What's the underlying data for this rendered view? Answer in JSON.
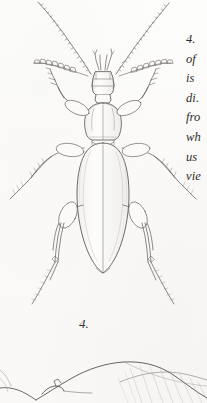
{
  "plate": {
    "background_color": "#fbfaf8",
    "ink_color": "#4a4743",
    "ink_light_color": "#8f8b86",
    "figure_number_label": "4.",
    "caption": {
      "note": "Italic caption text clipped by the right page margin",
      "lines": [
        "4.",
        "of",
        "is",
        "di.",
        "fro",
        "wh",
        "us",
        "vie"
      ]
    },
    "figures": [
      {
        "id": "figure-4",
        "label": "4.",
        "subject": "ground-beetle-dorsal-view",
        "orientation": "dorsal",
        "parts": [
          "left-antenna",
          "right-antenna",
          "head",
          "mandibles",
          "left-maxillary-palp",
          "right-maxillary-palp",
          "pronotum",
          "elytra",
          "elytral-suture",
          "left-foreleg",
          "right-foreleg",
          "left-midleg",
          "right-midleg",
          "left-hindleg",
          "right-hindleg"
        ]
      },
      {
        "id": "figure-partial-lateral",
        "label": "",
        "subject": "beetle-lateral-view-partial",
        "orientation": "lateral",
        "parts": [
          "elytron-hatched",
          "head-outline",
          "mandible"
        ]
      }
    ]
  }
}
